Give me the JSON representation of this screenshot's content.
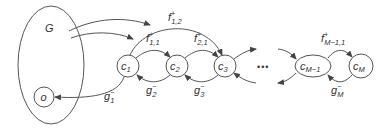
{
  "diagram": {
    "group": {
      "label": "G"
    },
    "origin": {
      "label": "o"
    },
    "nodes": [
      {
        "id": "c1",
        "base": "c",
        "sub": "1"
      },
      {
        "id": "c2",
        "base": "c",
        "sub": "2"
      },
      {
        "id": "c3",
        "base": "c",
        "sub": "3"
      },
      {
        "id": "cM-1",
        "base": "c",
        "sub": "M−1"
      },
      {
        "id": "cM",
        "base": "c",
        "sub": "M"
      }
    ],
    "ellipsis": "•••",
    "forward_edges": [
      {
        "from": "c1",
        "to": "c2",
        "base": "f",
        "sup": "+",
        "sub": "1,1"
      },
      {
        "from": "c2",
        "to": "c3",
        "base": "f",
        "sup": "+",
        "sub": "2,1"
      },
      {
        "from": "c1",
        "to": "c3",
        "base": "f",
        "sup": "+",
        "sub": "1,2"
      },
      {
        "from": "cM-1",
        "to": "cM",
        "base": "f",
        "sup": "+",
        "sub": "M−1,1"
      }
    ],
    "backward_edges": [
      {
        "from": "c1",
        "to": "o",
        "base": "g",
        "sup": "−",
        "sub": "1"
      },
      {
        "from": "c2",
        "to": "c1",
        "base": "g",
        "sup": "−",
        "sub": "2"
      },
      {
        "from": "c3",
        "to": "c2",
        "base": "g",
        "sup": "−",
        "sub": "3"
      },
      {
        "from": "cM",
        "to": "cM-1",
        "base": "g",
        "sup": "−",
        "sub": "M"
      }
    ]
  }
}
